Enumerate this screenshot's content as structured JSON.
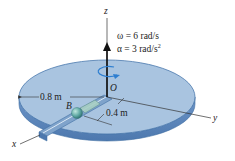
{
  "diagram": {
    "type": "rotating disk with slider in slot",
    "axes": {
      "x_label": "x",
      "y_label": "y",
      "z_label": "z",
      "origin_label": "O"
    },
    "given": {
      "omega_label": "ω = 6 rad/s",
      "alpha_label": "α = 3 rad/s",
      "alpha_exp": "2"
    },
    "dimensions": {
      "radius": "0.8 m",
      "slider_distance": "0.4 m"
    },
    "collar_label": "B",
    "colors": {
      "disk_top": "#a9c4e0",
      "disk_side": "#5d88bf",
      "disk_edge": "#3f6ea3",
      "slot": "#8fb0d4",
      "collar": "#5fa8a3",
      "rotation_arrow": "#2f7fd0",
      "axis": "#333333"
    }
  }
}
